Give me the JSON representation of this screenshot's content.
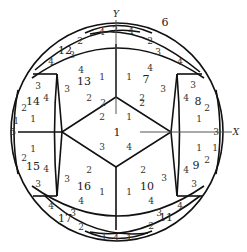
{
  "diagram": {
    "axes": {
      "x_label": "X",
      "y_label": "Y"
    },
    "colors": {
      "stroke": "#111111",
      "text": "#333333",
      "axis": "#555555"
    },
    "faces": [
      {
        "id": "1",
        "x": 117,
        "y": 132
      },
      {
        "id": "6",
        "x": 165,
        "y": 22
      },
      {
        "id": "7",
        "x": 146,
        "y": 79
      },
      {
        "id": "8",
        "x": 198,
        "y": 101
      },
      {
        "id": "9",
        "x": 196,
        "y": 165
      },
      {
        "id": "10",
        "x": 147,
        "y": 186
      },
      {
        "id": "11",
        "x": 166,
        "y": 217
      },
      {
        "id": "12",
        "x": 65,
        "y": 50
      },
      {
        "id": "13",
        "x": 84,
        "y": 81
      },
      {
        "id": "14",
        "x": 33,
        "y": 101
      },
      {
        "id": "15",
        "x": 33,
        "y": 166
      },
      {
        "id": "16",
        "x": 84,
        "y": 186
      },
      {
        "id": "17",
        "x": 65,
        "y": 218
      }
    ],
    "edge_labels": [
      {
        "t": "4",
        "x": 102,
        "y": 32
      },
      {
        "t": "2",
        "x": 115,
        "y": 30
      },
      {
        "t": "4",
        "x": 131,
        "y": 31
      },
      {
        "t": "2",
        "x": 80,
        "y": 41
      },
      {
        "t": "3",
        "x": 72,
        "y": 55
      },
      {
        "t": "4",
        "x": 51,
        "y": 62
      },
      {
        "t": "2",
        "x": 150,
        "y": 41
      },
      {
        "t": "3",
        "x": 158,
        "y": 52
      },
      {
        "t": "4",
        "x": 180,
        "y": 62
      },
      {
        "t": "4",
        "x": 81,
        "y": 70
      },
      {
        "t": "1",
        "x": 102,
        "y": 77
      },
      {
        "t": "3",
        "x": 67,
        "y": 89
      },
      {
        "t": "2",
        "x": 89,
        "y": 98
      },
      {
        "t": "1",
        "x": 129,
        "y": 77
      },
      {
        "t": "4",
        "x": 150,
        "y": 68
      },
      {
        "t": "3",
        "x": 163,
        "y": 89
      },
      {
        "t": "2",
        "x": 142,
        "y": 98
      },
      {
        "t": "3",
        "x": 38,
        "y": 86
      },
      {
        "t": "4",
        "x": 46,
        "y": 98
      },
      {
        "t": "2",
        "x": 24,
        "y": 108
      },
      {
        "t": "1",
        "x": 33,
        "y": 119
      },
      {
        "t": "3",
        "x": 193,
        "y": 85
      },
      {
        "t": "4",
        "x": 186,
        "y": 98
      },
      {
        "t": "2",
        "x": 207,
        "y": 108
      },
      {
        "t": "1",
        "x": 199,
        "y": 119
      },
      {
        "t": "2",
        "x": 102,
        "y": 117
      },
      {
        "t": "1",
        "x": 129,
        "y": 117
      },
      {
        "t": "3",
        "x": 102,
        "y": 147
      },
      {
        "t": "4",
        "x": 129,
        "y": 147
      },
      {
        "t": "2",
        "x": 103,
        "y": 103
      },
      {
        "t": "2",
        "x": 142,
        "y": 103
      },
      {
        "t": "5",
        "x": 13,
        "y": 132
      },
      {
        "t": "1",
        "x": 16,
        "y": 121
      },
      {
        "t": "3",
        "x": 216,
        "y": 132
      },
      {
        "t": "1",
        "x": 215,
        "y": 148
      },
      {
        "t": "1",
        "x": 33,
        "y": 149
      },
      {
        "t": "2",
        "x": 24,
        "y": 158
      },
      {
        "t": "4",
        "x": 46,
        "y": 169
      },
      {
        "t": "3",
        "x": 38,
        "y": 184
      },
      {
        "t": "1",
        "x": 199,
        "y": 148
      },
      {
        "t": "2",
        "x": 207,
        "y": 160
      },
      {
        "t": "4",
        "x": 186,
        "y": 170
      },
      {
        "t": "3",
        "x": 194,
        "y": 184
      },
      {
        "t": "2",
        "x": 89,
        "y": 170
      },
      {
        "t": "3",
        "x": 67,
        "y": 179
      },
      {
        "t": "1",
        "x": 102,
        "y": 192
      },
      {
        "t": "4",
        "x": 81,
        "y": 201
      },
      {
        "t": "2",
        "x": 143,
        "y": 170
      },
      {
        "t": "3",
        "x": 164,
        "y": 178
      },
      {
        "t": "1",
        "x": 129,
        "y": 192
      },
      {
        "t": "4",
        "x": 151,
        "y": 201
      },
      {
        "t": "4",
        "x": 51,
        "y": 206
      },
      {
        "t": "3",
        "x": 73,
        "y": 213
      },
      {
        "t": "2",
        "x": 81,
        "y": 227
      },
      {
        "t": "4",
        "x": 180,
        "y": 206
      },
      {
        "t": "3",
        "x": 159,
        "y": 213
      },
      {
        "t": "2",
        "x": 151,
        "y": 226
      },
      {
        "t": "1",
        "x": 104,
        "y": 237
      },
      {
        "t": "4",
        "x": 116,
        "y": 238
      },
      {
        "t": "1",
        "x": 129,
        "y": 238
      }
    ]
  }
}
